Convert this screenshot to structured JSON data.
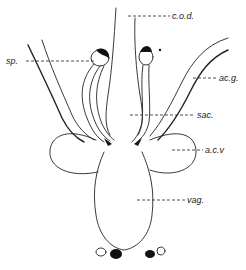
{
  "figure": {
    "type": "anatomical line drawing",
    "labels": [
      {
        "id": "cod",
        "text": "c.o.d.",
        "x": 172,
        "y": 11
      },
      {
        "id": "sp",
        "text": "sp.",
        "x": 6,
        "y": 56
      },
      {
        "id": "acg",
        "text": "ac.g.",
        "x": 219,
        "y": 72
      },
      {
        "id": "sac",
        "text": "sac.",
        "x": 197,
        "y": 110
      },
      {
        "id": "acv",
        "text": "a.c.v",
        "x": 205,
        "y": 145
      },
      {
        "id": "vag",
        "text": "vag.",
        "x": 187,
        "y": 195
      }
    ]
  }
}
